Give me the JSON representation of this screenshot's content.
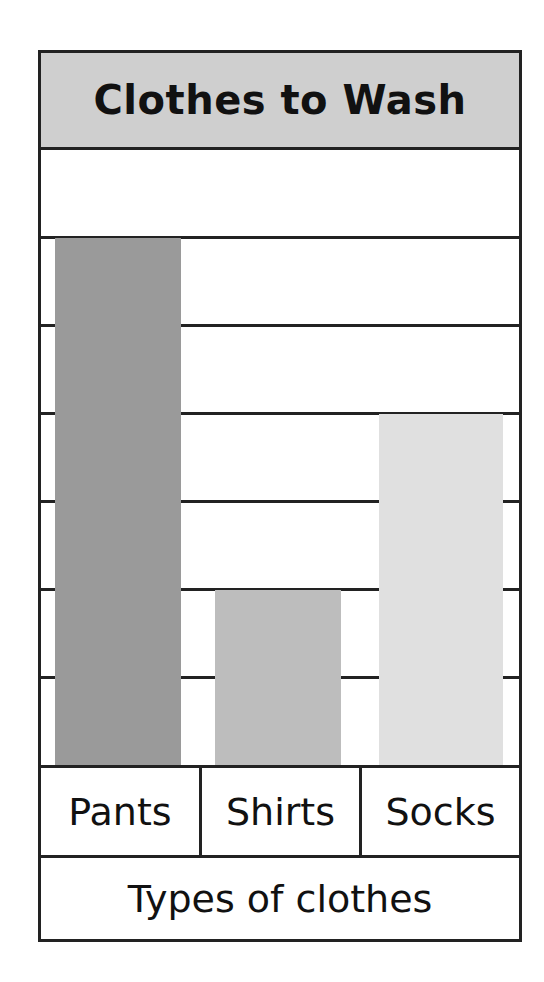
{
  "chart_data": {
    "type": "bar",
    "title": "Clothes to Wash",
    "categories": [
      "Pants",
      "Shirts",
      "Socks"
    ],
    "values": [
      6,
      2,
      4
    ],
    "xlabel": "Types of clothes",
    "ylabel": "",
    "ylim": [
      0,
      7
    ],
    "grid": true,
    "y_tick_labels_shown": false,
    "bar_colors": [
      "#9a9a9a",
      "#bdbdbd",
      "#e0e0e0"
    ],
    "legend": null
  },
  "colors": {
    "title_band": "#cfcfcf",
    "border": "#222222"
  }
}
